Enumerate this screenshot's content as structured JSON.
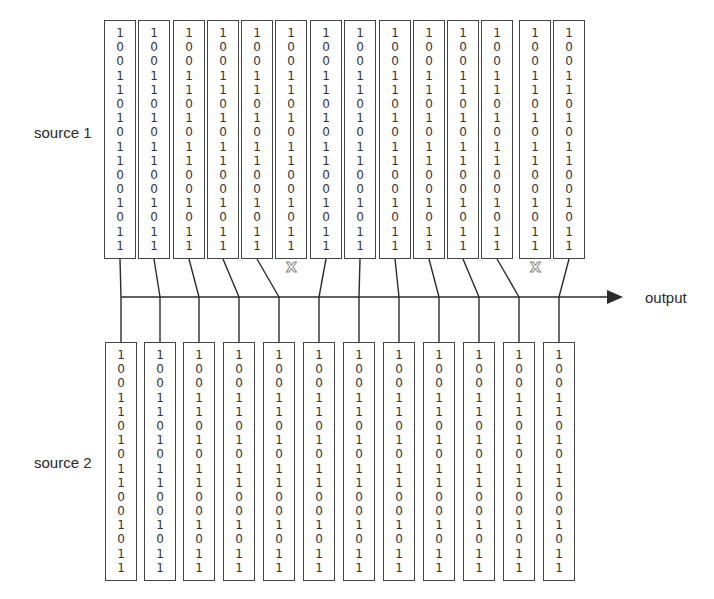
{
  "labels": {
    "source1": "source 1",
    "source2": "source 2",
    "output": "output"
  },
  "bits": [
    "1",
    "0",
    "0",
    "1",
    "1",
    "0",
    "1",
    "0",
    "1",
    "1",
    "0",
    "0",
    "1",
    "0",
    "1",
    "1"
  ],
  "drop_marker": "X",
  "source1": {
    "column_count": 14,
    "box_top": 20,
    "box_bottom": 259,
    "box_width": 32,
    "column_lefts": [
      104,
      138,
      173,
      207,
      241,
      275,
      310,
      344,
      379,
      413,
      447,
      481,
      519,
      553
    ],
    "dropped_columns": [
      5,
      12
    ]
  },
  "source2": {
    "column_count": 12,
    "box_top": 342,
    "box_bottom": 581,
    "box_width": 32,
    "column_lefts": [
      105,
      144,
      183,
      223,
      263,
      303,
      343,
      383,
      423,
      463,
      503,
      543
    ]
  },
  "output_line": {
    "y": 297,
    "x_start": 121,
    "x_end": 623,
    "junctions": [
      121,
      160,
      199,
      239,
      279,
      319,
      359,
      399,
      439,
      479,
      519,
      559
    ]
  },
  "connections_source1": [
    {
      "col": 0,
      "junction": 0
    },
    {
      "col": 1,
      "junction": 1
    },
    {
      "col": 2,
      "junction": 2
    },
    {
      "col": 3,
      "junction": 3
    },
    {
      "col": 4,
      "junction": 4
    },
    {
      "col": 6,
      "junction": 5
    },
    {
      "col": 7,
      "junction": 6
    },
    {
      "col": 8,
      "junction": 7
    },
    {
      "col": 9,
      "junction": 8
    },
    {
      "col": 10,
      "junction": 9
    },
    {
      "col": 11,
      "junction": 10
    },
    {
      "col": 13,
      "junction": 11
    }
  ],
  "colors": {
    "line": "#2b2b2b",
    "box_border": "#444444",
    "drop_marker": "#8a8a8a"
  }
}
